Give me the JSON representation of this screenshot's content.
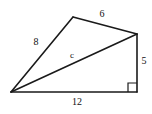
{
  "figure": {
    "type": "geometry-diagram",
    "background_color": "#ffffff",
    "stroke_color": "#1a1a1a",
    "text_color": "#111111",
    "canvas": {
      "width": 152,
      "height": 114
    },
    "vertices": [
      {
        "id": "A",
        "name": "left-vertex",
        "x": 11,
        "y": 92
      },
      {
        "id": "B",
        "name": "top-vertex",
        "x": 73,
        "y": 17
      },
      {
        "id": "C",
        "name": "right-vertex",
        "x": 137,
        "y": 34
      },
      {
        "id": "D",
        "name": "bottom-right-vertex",
        "x": 137,
        "y": 92
      }
    ],
    "edges": [
      {
        "id": "AB",
        "name": "side-ab",
        "from": "A",
        "to": "B",
        "label": "8"
      },
      {
        "id": "BC",
        "name": "side-bc",
        "from": "B",
        "to": "C",
        "label": "6"
      },
      {
        "id": "CD",
        "name": "side-cd",
        "from": "C",
        "to": "D",
        "label": "5"
      },
      {
        "id": "DA",
        "name": "side-da",
        "from": "D",
        "to": "A",
        "label": "12"
      },
      {
        "id": "AC",
        "name": "diagonal-ac",
        "from": "A",
        "to": "C",
        "label": "c"
      }
    ],
    "labels": {
      "side_ab": "8",
      "side_bc": "6",
      "side_cd": "5",
      "side_da": "12",
      "diagonal_ac": "c"
    },
    "label_positions": {
      "side_ab": {
        "x": 36,
        "y": 42
      },
      "side_bc": {
        "x": 102,
        "y": 14
      },
      "side_cd": {
        "x": 144,
        "y": 61
      },
      "side_da": {
        "x": 77,
        "y": 102
      },
      "diagonal_ac": {
        "x": 72,
        "y": 55
      }
    },
    "right_angle": {
      "name": "right-angle-marker",
      "at_vertex": "D",
      "size": 9,
      "x": 128,
      "y": 82
    }
  }
}
